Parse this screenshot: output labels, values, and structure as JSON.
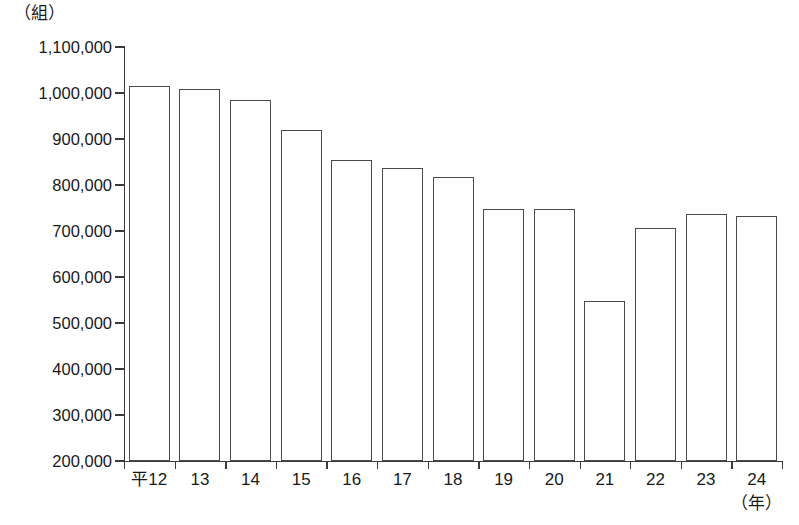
{
  "chart_data": {
    "type": "bar",
    "title": "",
    "subtitle": "",
    "unit_label": "（組）",
    "xlabel": "（年）",
    "ylabel": "",
    "grid": false,
    "legend": null,
    "ylim": [
      200000,
      1100000
    ],
    "ytick_step": 100000,
    "ytick_labels": [
      "1,100,000",
      "1,000,000",
      "900,000",
      "800,000",
      "700,000",
      "600,000",
      "500,000",
      "400,000",
      "300,000",
      "200,000"
    ],
    "ytick_values": [
      1100000,
      1000000,
      900000,
      800000,
      700000,
      600000,
      500000,
      400000,
      300000,
      200000
    ],
    "categories": [
      "平12",
      "13",
      "14",
      "15",
      "16",
      "17",
      "18",
      "19",
      "20",
      "21",
      "22",
      "23",
      "24"
    ],
    "values": [
      1015000,
      1008000,
      985000,
      920000,
      855000,
      838000,
      817000,
      748000,
      748000,
      548000,
      707000,
      738000,
      733000
    ],
    "bar_fill": "#ffffff",
    "bar_stroke": "#4a4a4a",
    "axis_color": "#3b3b3b",
    "background": "#ffffff"
  }
}
